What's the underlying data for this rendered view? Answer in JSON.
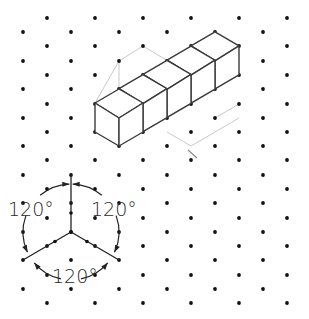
{
  "figure": {
    "colors": {
      "background": "#ffffff",
      "dot": "#111111",
      "sketch_line": "#3a3a3a",
      "guide_line": "#c8c8c8",
      "axis_line": "#222222"
    },
    "grid": {
      "col_spacing": 48,
      "row_spacing": 14.3,
      "rows_a": {
        "x_start": 23,
        "y_values": [
          32,
          61,
          89,
          118,
          146,
          175,
          203,
          232,
          260,
          289
        ]
      },
      "rows_b": {
        "x_start": 47,
        "y_values": [
          18,
          46,
          75,
          104,
          132,
          160,
          189,
          218,
          246,
          275,
          303
        ]
      },
      "cols": 6
    },
    "cubes": {
      "count": 5,
      "description": "Five isometric cubes sketched in a row receding toward the upper right",
      "front_cube": {
        "top": [
          [
            95,
            103
          ],
          [
            119,
            89
          ],
          [
            143,
            103
          ],
          [
            119,
            118
          ]
        ],
        "front_left": [
          [
            95,
            103
          ],
          [
            119,
            118
          ],
          [
            119,
            146
          ],
          [
            95,
            132
          ]
        ],
        "front_right": [
          [
            119,
            118
          ],
          [
            143,
            103
          ],
          [
            143,
            132
          ],
          [
            119,
            146
          ]
        ]
      },
      "step": [
        24,
        -14.3
      ]
    },
    "axis_diagram": {
      "center": [
        71,
        232
      ],
      "radius": 48,
      "axes": [
        {
          "name": "vertical",
          "end": [
            71,
            175
          ]
        },
        {
          "name": "lower-left",
          "end": [
            23,
            260
          ]
        },
        {
          "name": "lower-right",
          "end": [
            119,
            260
          ]
        }
      ],
      "labels": [
        {
          "text": "120°",
          "x": 8,
          "y": 216,
          "position": "upper-left"
        },
        {
          "text": "120°",
          "x": 91,
          "y": 216,
          "position": "upper-right"
        },
        {
          "text": "120°",
          "x": 52,
          "y": 283,
          "position": "bottom"
        }
      ]
    }
  }
}
